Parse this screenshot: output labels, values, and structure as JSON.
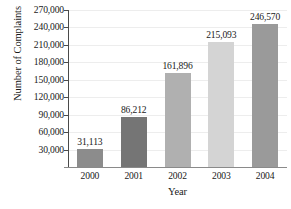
{
  "chart_data": {
    "type": "bar",
    "title": "",
    "xlabel": "Year",
    "ylabel": "Number of Complaints",
    "categories": [
      "2000",
      "2001",
      "2002",
      "2003",
      "2004"
    ],
    "values": [
      31113,
      86212,
      161896,
      215093,
      246570
    ],
    "value_labels": [
      "31,113",
      "86,212",
      "161,896",
      "215,093",
      "246,570"
    ],
    "ylim": [
      0,
      270000
    ],
    "ytick_values": [
      30000,
      60000,
      90000,
      120000,
      150000,
      180000,
      210000,
      240000,
      270000
    ],
    "ytick_labels": [
      "30,000",
      "60,000",
      "90,000",
      "120,000",
      "150,000",
      "180,000",
      "210,000",
      "240,000",
      "270,000"
    ],
    "bar_colors": [
      "#8c8c8c",
      "#757575",
      "#b0b0b0",
      "#d4d4d4",
      "#9a9a9a"
    ],
    "grid": true,
    "grid_axis": "y",
    "grid_color": "#ededed",
    "legend": "none",
    "axis_color": "#4a4a4a",
    "background": "#ffffff"
  },
  "axes": {
    "y_title": "Number of Complaints",
    "x_title": "Year"
  }
}
